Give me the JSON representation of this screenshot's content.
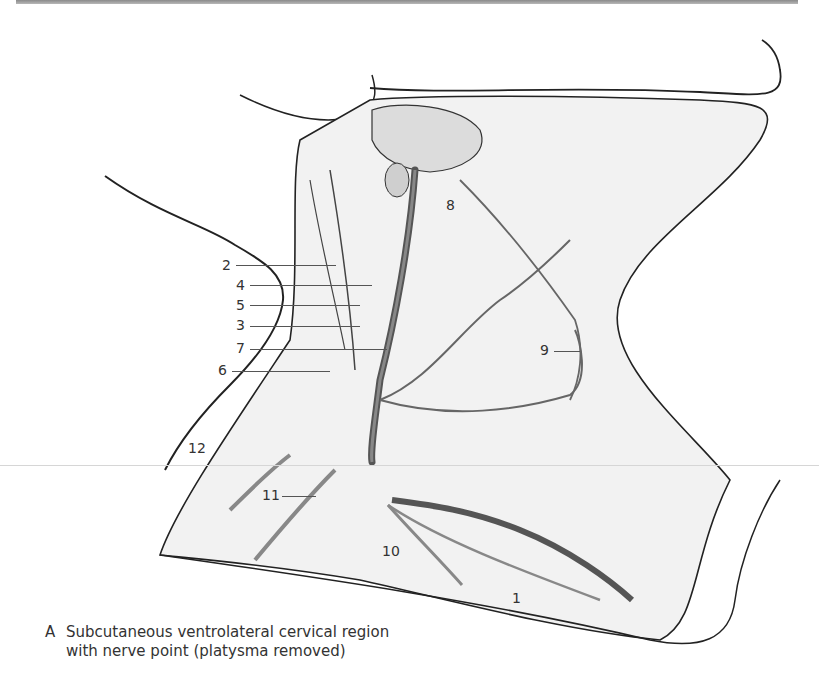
{
  "figure": {
    "panel_letter": "A",
    "caption": "Subcutaneous ventrolateral cervical region with nerve point (platysma removed)",
    "caption_line1": "Subcutaneous ventrolateral cervical region",
    "caption_line2": "with nerve point (platysma removed)"
  },
  "labels": [
    {
      "id": "1",
      "text": "1"
    },
    {
      "id": "2",
      "text": "2"
    },
    {
      "id": "3",
      "text": "3"
    },
    {
      "id": "4",
      "text": "4"
    },
    {
      "id": "5",
      "text": "5"
    },
    {
      "id": "6",
      "text": "6"
    },
    {
      "id": "7",
      "text": "7"
    },
    {
      "id": "8",
      "text": "8"
    },
    {
      "id": "9",
      "text": "9"
    },
    {
      "id": "10",
      "text": "10"
    },
    {
      "id": "11",
      "text": "11"
    },
    {
      "id": "12",
      "text": "12"
    }
  ],
  "colors": {
    "line": "#222222",
    "shade": "#e6e6e6",
    "nerve": "#6e6e6e",
    "label": "#333333"
  }
}
